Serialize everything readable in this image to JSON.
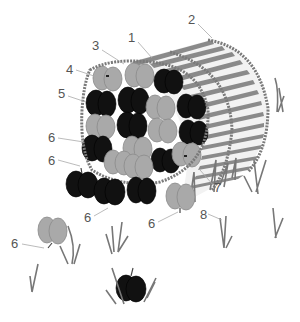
{
  "figure": {
    "colors": {
      "background": "#ffffff",
      "apple_light": "#a9a9a9",
      "apple_dark": "#111111",
      "basket": "#8a8a8a",
      "grass": "#777777",
      "callout_text": "#555555",
      "leader_line": "#aaaaaa"
    },
    "callouts": [
      {
        "label": "1",
        "x": 132,
        "y": 40,
        "target": "basket-slats"
      },
      {
        "label": "2",
        "x": 192,
        "y": 22,
        "target": "basket-back-rim"
      },
      {
        "label": "3",
        "x": 96,
        "y": 48,
        "target": "basket-front-rim-top"
      },
      {
        "label": "4",
        "x": 70,
        "y": 72,
        "target": "light-apple-top-left"
      },
      {
        "label": "5",
        "x": 62,
        "y": 96,
        "target": "basket-front-rim-left"
      },
      {
        "label": "6",
        "x": 52,
        "y": 140,
        "target": "dark-apple-left"
      },
      {
        "label": "6",
        "x": 52,
        "y": 163,
        "target": "dark-apple-spilled-left"
      },
      {
        "label": "6",
        "x": 88,
        "y": 220,
        "target": "dark-apple-spilled-bottom"
      },
      {
        "label": "6",
        "x": 152,
        "y": 226,
        "target": "light-apple-spilled-right"
      },
      {
        "label": "6",
        "x": 15,
        "y": 246,
        "target": "light-apple-far-left"
      },
      {
        "label": "7",
        "x": 218,
        "y": 190,
        "target": "light-apple-right-in-basket"
      },
      {
        "label": "8",
        "x": 204,
        "y": 217,
        "target": "grass-tuft"
      }
    ]
  }
}
